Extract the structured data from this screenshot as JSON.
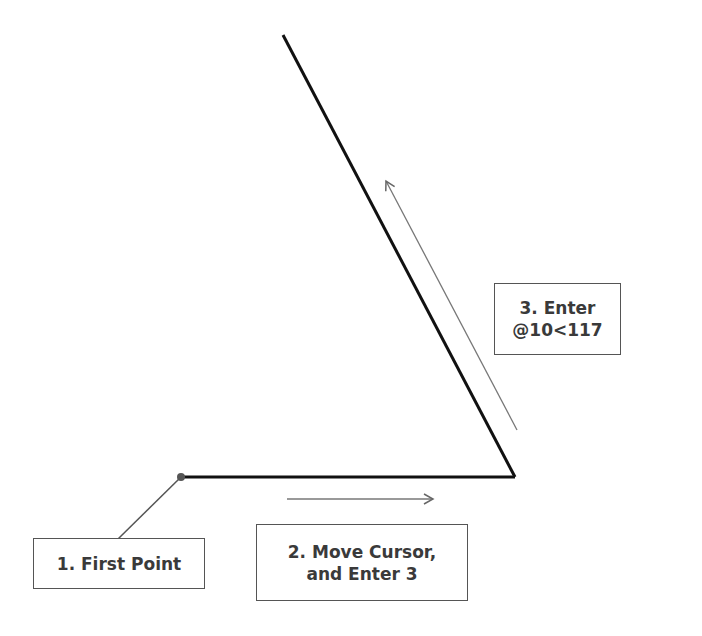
{
  "diagram": {
    "labels": {
      "step1": "1. First Point",
      "step2_line1": "2. Move Cursor,",
      "step2_line2": "and Enter 3",
      "step3_line1": "3. Enter",
      "step3_line2": "@10<117"
    },
    "colors": {
      "line": "#111111",
      "arrow": "#777777",
      "leader": "#555555",
      "box_border": "#555555",
      "text": "#3a3a3a"
    }
  }
}
